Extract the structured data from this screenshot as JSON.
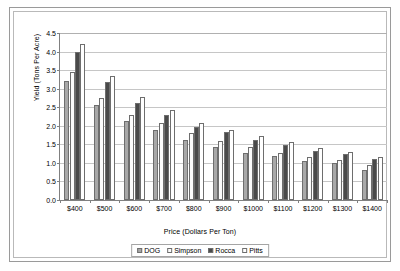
{
  "chart_data": {
    "type": "bar",
    "title": "",
    "xlabel": "Price (Dollars Per Ton)",
    "ylabel": "Yield (Tons Per Acre)",
    "ylim": [
      0.0,
      4.5
    ],
    "ytick_labels": [
      "0.0",
      "0.5",
      "1.0",
      "1.5",
      "2.0",
      "2.5",
      "3.0",
      "3.5",
      "4.0",
      "4.5"
    ],
    "ytick_values": [
      0.0,
      0.5,
      1.0,
      1.5,
      2.0,
      2.5,
      3.0,
      3.5,
      4.0,
      4.5
    ],
    "grid": true,
    "legend_position": "bottom",
    "categories": [
      "$400",
      "$500",
      "$600",
      "$700",
      "$800",
      "$900",
      "$1000",
      "$1100",
      "$1200",
      "$1300",
      "$1400"
    ],
    "series": [
      {
        "name": "DOG",
        "color": "#a8a8a8",
        "values": [
          3.2,
          2.55,
          2.12,
          1.88,
          1.62,
          1.42,
          1.28,
          1.18,
          1.05,
          1.0,
          0.82
        ]
      },
      {
        "name": "Simpson",
        "color": "#fbfbfb",
        "values": [
          3.45,
          2.75,
          2.3,
          2.08,
          1.8,
          1.58,
          1.42,
          1.28,
          1.15,
          1.08,
          0.95
        ]
      },
      {
        "name": "Rocca",
        "color": "#4a4a4a",
        "values": [
          4.0,
          3.18,
          2.62,
          2.3,
          1.98,
          1.82,
          1.62,
          1.48,
          1.32,
          1.25,
          1.1
        ]
      },
      {
        "name": "Pitts",
        "color": "#ffffff",
        "values": [
          4.2,
          3.35,
          2.78,
          2.42,
          2.08,
          1.88,
          1.72,
          1.55,
          1.4,
          1.3,
          1.15
        ]
      }
    ]
  },
  "legend": {
    "items": [
      {
        "label": "DOG"
      },
      {
        "label": "Simpson"
      },
      {
        "label": "Rocca"
      },
      {
        "label": "Pitts"
      }
    ]
  }
}
